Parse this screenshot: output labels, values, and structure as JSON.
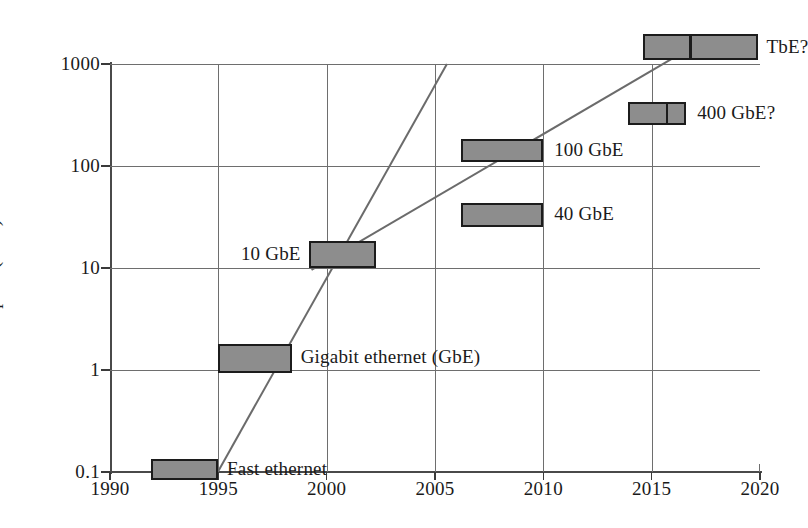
{
  "chart_data": {
    "type": "bar",
    "title": "",
    "xlabel": "",
    "ylabel": "Link Speed (Gb/s)",
    "xlim": [
      1990,
      2020
    ],
    "ylim": [
      0.1,
      1000
    ],
    "yscale": "log",
    "grid": true,
    "legend": "none",
    "xticks": [
      "1990",
      "1995",
      "2000",
      "2005",
      "2010",
      "2015",
      "2020"
    ],
    "yticks": [
      "0.1",
      "1",
      "10",
      "100",
      "1000"
    ],
    "boxes": [
      {
        "label": "Fast ethernet",
        "x_start": 1991.9,
        "x_end": 1995.0,
        "y_low": 0.083,
        "y_high": 0.135,
        "split_at": null,
        "label_x": 1995.4,
        "label_y": 0.105,
        "label_anchor": "left"
      },
      {
        "label": "Gigabit ethernet (GbE)",
        "x_start": 1995.0,
        "x_end": 1998.4,
        "y_low": 0.93,
        "y_high": 1.8,
        "split_at": null,
        "label_x": 1998.8,
        "label_y": 1.3,
        "label_anchor": "left"
      },
      {
        "label": "10 GbE",
        "x_start": 1999.2,
        "x_end": 2002.3,
        "y_low": 10.0,
        "y_high": 18.5,
        "split_at": null,
        "label_x": 1998.8,
        "label_y": 13.5,
        "label_anchor": "right"
      },
      {
        "label": "40 GbE",
        "x_start": 2006.2,
        "x_end": 2010.0,
        "y_low": 25.0,
        "y_high": 43.0,
        "split_at": null,
        "label_x": 2010.5,
        "label_y": 33.0,
        "label_anchor": "left"
      },
      {
        "label": "100 GbE",
        "x_start": 2006.2,
        "x_end": 2010.0,
        "y_low": 110.0,
        "y_high": 185.0,
        "split_at": null,
        "label_x": 2010.5,
        "label_y": 140.0,
        "label_anchor": "left"
      },
      {
        "label": "400 GbE?",
        "x_start": 2013.9,
        "x_end": 2016.6,
        "y_low": 255.0,
        "y_high": 420.0,
        "split_at": 2015.6,
        "label_x": 2017.1,
        "label_y": 325.0,
        "label_anchor": "left"
      },
      {
        "label": "TbE?",
        "x_start": 2014.6,
        "x_end": 2019.9,
        "y_low": 1100.0,
        "y_high": 1950.0,
        "split_at": 2016.7,
        "label_x": 2020.3,
        "label_y": 1450.0,
        "label_anchor": "left"
      }
    ],
    "trend_lines": [
      {
        "name": "steep-trend",
        "points": [
          {
            "x": 1994.95,
            "y": 0.098
          },
          {
            "x": 2005.55,
            "y": 1000.0
          }
        ]
      },
      {
        "name": "shallow-trend",
        "points": [
          {
            "x": 1999.3,
            "y": 9.6
          },
          {
            "x": 2016.3,
            "y": 1250.0
          }
        ]
      }
    ]
  }
}
